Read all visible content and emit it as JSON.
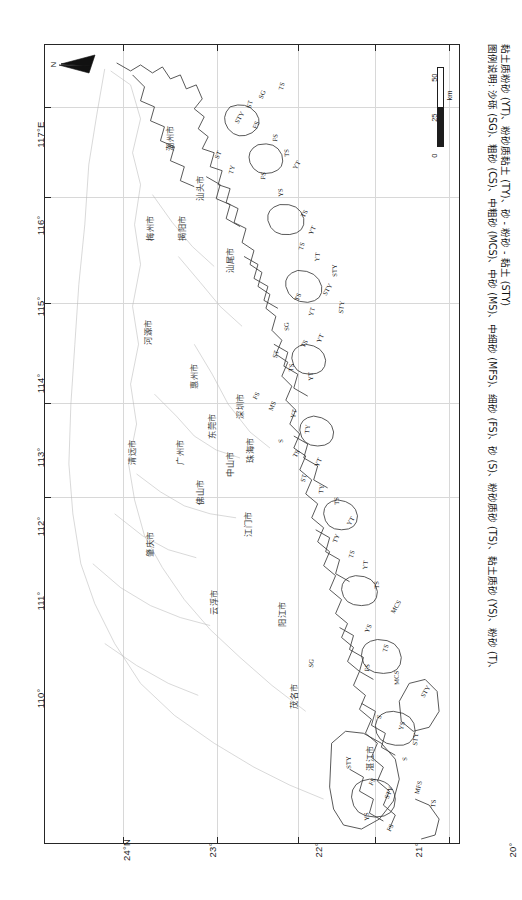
{
  "figure": {
    "type": "map",
    "region": "广东省沿海",
    "orientation_note": "map rotated 90 degrees; north points left"
  },
  "north_arrow": {
    "label": "N",
    "name": "north-arrow"
  },
  "scale_bar": {
    "ticks": [
      "0",
      "25",
      "50"
    ],
    "unit": "km"
  },
  "axes": {
    "longitude": {
      "labels": [
        "117°E",
        "116°",
        "115°",
        "114°",
        "113°",
        "112°",
        "111°",
        "110°"
      ],
      "positions_px": [
        78,
        172,
        253,
        330,
        404,
        473,
        548,
        645
      ]
    },
    "latitude": {
      "labels": [
        "24°N",
        "23°",
        "22°",
        "21°",
        "20°"
      ],
      "positions_px": [
        62,
        152,
        258,
        358,
        452
      ]
    }
  },
  "cities": [
    {
      "name": "潮州市",
      "x": 118,
      "y": 106
    },
    {
      "name": "梅州市",
      "x": 98,
      "y": 196
    },
    {
      "name": "揭阳市",
      "x": 130,
      "y": 196
    },
    {
      "name": "汕头市",
      "x": 148,
      "y": 156
    },
    {
      "name": "汕尾市",
      "x": 178,
      "y": 228
    },
    {
      "name": "河源市",
      "x": 96,
      "y": 300
    },
    {
      "name": "惠州市",
      "x": 142,
      "y": 344
    },
    {
      "name": "深圳市",
      "x": 188,
      "y": 374
    },
    {
      "name": "东莞市",
      "x": 160,
      "y": 394
    },
    {
      "name": "广州市",
      "x": 128,
      "y": 420
    },
    {
      "name": "中山市",
      "x": 178,
      "y": 432
    },
    {
      "name": "珠海市",
      "x": 198,
      "y": 418
    },
    {
      "name": "佛山市",
      "x": 148,
      "y": 460
    },
    {
      "name": "清远市",
      "x": 80,
      "y": 420
    },
    {
      "name": "江门市",
      "x": 196,
      "y": 492
    },
    {
      "name": "肇庆市",
      "x": 98,
      "y": 512
    },
    {
      "name": "云浮市",
      "x": 162,
      "y": 570
    },
    {
      "name": "阳江市",
      "x": 230,
      "y": 582
    },
    {
      "name": "茂名市",
      "x": 242,
      "y": 664
    },
    {
      "name": "湛江市",
      "x": 318,
      "y": 726
    }
  ],
  "sediment_codes": [
    {
      "code": "STY",
      "x": 188,
      "y": 76
    },
    {
      "code": "FS",
      "x": 206,
      "y": 82
    },
    {
      "code": "ST",
      "x": 200,
      "y": 62
    },
    {
      "code": "FS",
      "x": 226,
      "y": 96
    },
    {
      "code": "TS",
      "x": 238,
      "y": 112
    },
    {
      "code": "YT",
      "x": 246,
      "y": 122
    },
    {
      "code": "ST",
      "x": 168,
      "y": 112
    },
    {
      "code": "TY",
      "x": 182,
      "y": 128
    },
    {
      "code": "FS",
      "x": 214,
      "y": 134
    },
    {
      "code": "YS",
      "x": 232,
      "y": 152
    },
    {
      "code": "TS",
      "x": 254,
      "y": 170
    },
    {
      "code": "YT",
      "x": 262,
      "y": 188
    },
    {
      "code": "TS",
      "x": 252,
      "y": 204
    },
    {
      "code": "YT",
      "x": 268,
      "y": 216
    },
    {
      "code": "STY",
      "x": 286,
      "y": 232
    },
    {
      "code": "STY",
      "x": 276,
      "y": 248
    },
    {
      "code": "TS",
      "x": 248,
      "y": 254
    },
    {
      "code": "YT",
      "x": 262,
      "y": 270
    },
    {
      "code": "STY",
      "x": 292,
      "y": 268
    },
    {
      "code": "SG",
      "x": 238,
      "y": 286
    },
    {
      "code": "TS",
      "x": 254,
      "y": 300
    },
    {
      "code": "YT",
      "x": 270,
      "y": 296
    },
    {
      "code": "ST",
      "x": 226,
      "y": 312
    },
    {
      "code": "TS",
      "x": 242,
      "y": 326
    },
    {
      "code": "YT",
      "x": 262,
      "y": 336
    },
    {
      "code": "FS",
      "x": 206,
      "y": 352
    },
    {
      "code": "MS",
      "x": 222,
      "y": 364
    },
    {
      "code": "YT",
      "x": 244,
      "y": 372
    },
    {
      "code": "TY",
      "x": 258,
      "y": 388
    },
    {
      "code": "S",
      "x": 232,
      "y": 398
    },
    {
      "code": "TS",
      "x": 246,
      "y": 410
    },
    {
      "code": "YT",
      "x": 268,
      "y": 420
    },
    {
      "code": "ST",
      "x": 254,
      "y": 436
    },
    {
      "code": "TY",
      "x": 272,
      "y": 448
    },
    {
      "code": "TS",
      "x": 288,
      "y": 460
    },
    {
      "code": "YT",
      "x": 300,
      "y": 478
    },
    {
      "code": "TY",
      "x": 286,
      "y": 496
    },
    {
      "code": "TS",
      "x": 302,
      "y": 512
    },
    {
      "code": "YT",
      "x": 316,
      "y": 524
    },
    {
      "code": "TS",
      "x": 328,
      "y": 544
    },
    {
      "code": "MCS",
      "x": 344,
      "y": 566
    },
    {
      "code": "YS",
      "x": 318,
      "y": 586
    },
    {
      "code": "TS",
      "x": 336,
      "y": 606
    },
    {
      "code": "FS",
      "x": 318,
      "y": 626
    },
    {
      "code": "MCS",
      "x": 348,
      "y": 640
    },
    {
      "code": "STY",
      "x": 374,
      "y": 650
    },
    {
      "code": "S",
      "x": 330,
      "y": 672
    },
    {
      "code": "YS",
      "x": 352,
      "y": 684
    },
    {
      "code": "STY",
      "x": 366,
      "y": 700
    },
    {
      "code": "STY",
      "x": 300,
      "y": 724
    },
    {
      "code": "FS",
      "x": 322,
      "y": 738
    },
    {
      "code": "STY",
      "x": 338,
      "y": 752
    },
    {
      "code": "MFS",
      "x": 368,
      "y": 748
    },
    {
      "code": "TS",
      "x": 384,
      "y": 762
    },
    {
      "code": "YS",
      "x": 318,
      "y": 776
    },
    {
      "code": "FS",
      "x": 340,
      "y": 784
    },
    {
      "code": "SG",
      "x": 212,
      "y": 52
    },
    {
      "code": "TS",
      "x": 232,
      "y": 44
    },
    {
      "code": "SG",
      "x": 262,
      "y": 622
    },
    {
      "code": "S",
      "x": 356,
      "y": 716
    }
  ],
  "caption": {
    "line1": "图例说明: 沙砾 (SG)、粗砂 (CS)、中粗砂 (MCS)、中砂 (MS)、中细砂 (MFS)、细砂 (FS)、砂 (S)、粉砂质砂 (TS)、黏土质砂 (YS)、粉砂 (T)、",
    "line2": "黏土质粉砂 (YT)、粉砂质黏土 (TY)、砂 - 粉砂 - 黏土 (STY)"
  }
}
